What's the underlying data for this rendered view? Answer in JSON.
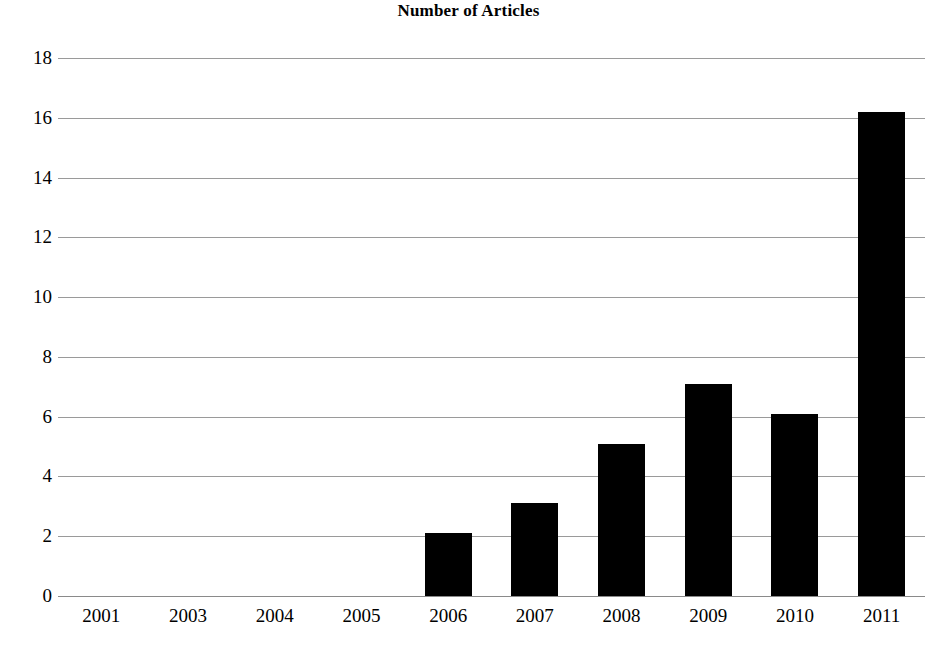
{
  "chart_data": {
    "type": "bar",
    "title": "Number of Articles",
    "xlabel": "",
    "ylabel": "",
    "categories": [
      "2001",
      "2003",
      "2004",
      "2005",
      "2006",
      "2007",
      "2008",
      "2009",
      "2010",
      "2011"
    ],
    "values": [
      0,
      0,
      0,
      0,
      2.1,
      3.1,
      5.1,
      7.1,
      6.1,
      16.2
    ],
    "series": [
      {
        "name": "Number of Articles",
        "values": [
          0,
          0,
          0,
          0,
          2.1,
          3.1,
          5.1,
          7.1,
          6.1,
          16.2
        ]
      }
    ],
    "ylim": [
      0,
      18
    ],
    "ytick_labels": [
      "0",
      "2",
      "4",
      "6",
      "8",
      "10",
      "12",
      "14",
      "16",
      "18"
    ],
    "ytick_values": [
      0,
      2,
      4,
      6,
      8,
      10,
      12,
      14,
      16,
      18
    ],
    "grid": true,
    "legend": false,
    "legend_position": "none",
    "bar_color": "#000000",
    "grid_color": "#9a9a9a",
    "background_color": "#ffffff"
  }
}
